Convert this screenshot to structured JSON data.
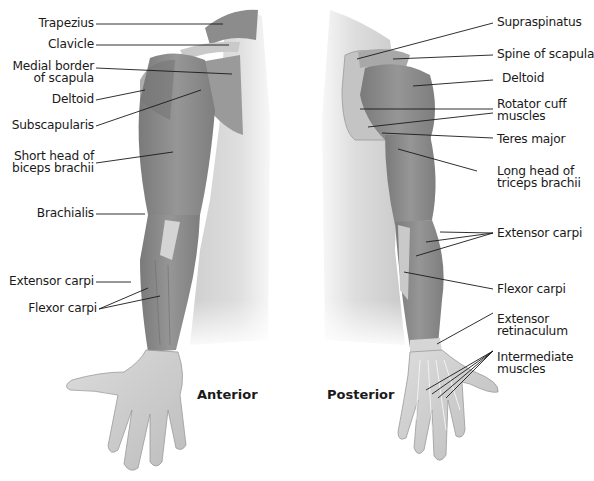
{
  "figure": {
    "views": [
      {
        "id": "anterior",
        "title": "Anterior"
      },
      {
        "id": "posterior",
        "title": "Posterior"
      }
    ],
    "anterior_labels": [
      {
        "lines": [
          "Trapezius"
        ]
      },
      {
        "lines": [
          "Clavicle"
        ]
      },
      {
        "lines": [
          "Medial border",
          "of scapula"
        ]
      },
      {
        "lines": [
          "Deltoid"
        ]
      },
      {
        "lines": [
          "Subscapularis"
        ]
      },
      {
        "lines": [
          "Short head of",
          "biceps brachii"
        ]
      },
      {
        "lines": [
          "Brachialis"
        ]
      },
      {
        "lines": [
          "Extensor carpi"
        ]
      },
      {
        "lines": [
          "Flexor carpi"
        ]
      }
    ],
    "posterior_labels": [
      {
        "lines": [
          "Supraspinatus"
        ]
      },
      {
        "lines": [
          "Spine of scapula"
        ]
      },
      {
        "lines": [
          "Deltoid"
        ]
      },
      {
        "lines": [
          "Rotator cuff",
          "muscles"
        ]
      },
      {
        "lines": [
          "Teres major"
        ]
      },
      {
        "lines": [
          "Long head of",
          "triceps brachii"
        ]
      },
      {
        "lines": [
          "Extensor carpi"
        ]
      },
      {
        "lines": [
          "Flexor carpi"
        ]
      },
      {
        "lines": [
          "Extensor",
          "retinaculum"
        ]
      },
      {
        "lines": [
          "Intermediate",
          "muscles"
        ]
      }
    ],
    "colors": {
      "muscle": "#8a8a8a",
      "skin": "#d8d8d8",
      "leader_line": "#1a1a1a",
      "background": "#ffffff"
    }
  }
}
